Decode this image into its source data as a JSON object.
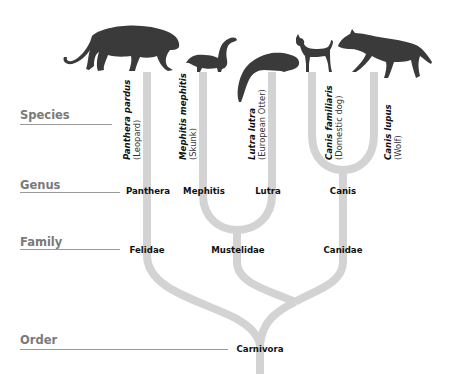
{
  "ranks": [
    {
      "label": "Species"
    },
    {
      "label": "Genus"
    },
    {
      "label": "Family"
    },
    {
      "label": "Order"
    }
  ],
  "species": [
    {
      "scientific": "Panthera pardus",
      "common": "(Leopard)",
      "icon": "leopard-silhouette"
    },
    {
      "scientific": "Mephitis mephitis",
      "common": "(Skunk)",
      "icon": "skunk-silhouette"
    },
    {
      "scientific": "Lutra lutra",
      "common": "(European Otter)",
      "icon": "otter-silhouette"
    },
    {
      "scientific": "Canis familiaris",
      "common": "(Domestic dog)",
      "icon": "dog-silhouette"
    },
    {
      "scientific": "Canis lupus",
      "common": "(Wolf)",
      "icon": "wolf-silhouette"
    }
  ],
  "genera": [
    "Panthera",
    "Mephitis",
    "Lutra",
    "Canis"
  ],
  "families": [
    "Felidae",
    "Mustelidae",
    "Canidae"
  ],
  "order": "Carnivora",
  "colors": {
    "branch": "#d3d3d3",
    "silhouette": "#3a3a3a",
    "rank_label": "#7a7a7a",
    "rule": "#9a9a9a",
    "taxon_text": "#111111"
  }
}
